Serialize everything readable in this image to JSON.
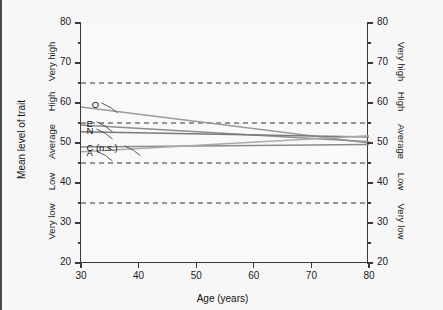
{
  "axes": {
    "x": {
      "title": "Age (years)",
      "ticks": [
        "30",
        "40",
        "50",
        "60",
        "70",
        "80"
      ],
      "min": 30,
      "max": 80
    },
    "y": {
      "title": "Mean level of trait",
      "ticks": [
        "20",
        "30",
        "40",
        "50",
        "60",
        "70",
        "80"
      ],
      "min": 20,
      "max": 80,
      "minor_step": 5,
      "bands": [
        "Very low",
        "Low",
        "Average",
        "High",
        "Very high"
      ],
      "band_centers": [
        30,
        40,
        50,
        60,
        70
      ]
    }
  },
  "reference_lines": {
    "values": [
      35,
      45,
      55,
      65
    ],
    "style": "dashed",
    "color": "#333333"
  },
  "chart_data": {
    "type": "line",
    "title": "",
    "subtitle": "",
    "xlabel": "Age (years)",
    "ylabel": "Mean level of trait",
    "xlim": [
      30,
      80
    ],
    "ylim": [
      20,
      80
    ],
    "grid": false,
    "legend": "inline-labels-left",
    "x": [
      30,
      80
    ],
    "series": [
      {
        "name": "O",
        "label": "O",
        "values": [
          59.0,
          50.0
        ],
        "color": "#9a9a9a"
      },
      {
        "name": "E",
        "label": "E",
        "values": [
          54.5,
          50.3
        ],
        "color": "#8e8e8e"
      },
      {
        "name": "N",
        "label": "N",
        "values": [
          52.8,
          51.5
        ],
        "color": "#7a7a7a"
      },
      {
        "name": "C",
        "label": "C (n.s.)",
        "values": [
          49.0,
          49.6
        ],
        "color": "#8a8a8a"
      },
      {
        "name": "A",
        "label": "A",
        "values": [
          47.8,
          51.8
        ],
        "color": "#aaaaaa"
      }
    ],
    "annotations": [
      {
        "text": "O",
        "x": 31.5,
        "y": 59.5
      },
      {
        "text": "E",
        "x": 30.6,
        "y": 54.8
      },
      {
        "text": "N",
        "x": 30.6,
        "y": 53.0
      },
      {
        "text": "C (n.s.)",
        "x": 30.6,
        "y": 48.8
      },
      {
        "text": "A",
        "x": 30.6,
        "y": 47.5
      }
    ]
  }
}
